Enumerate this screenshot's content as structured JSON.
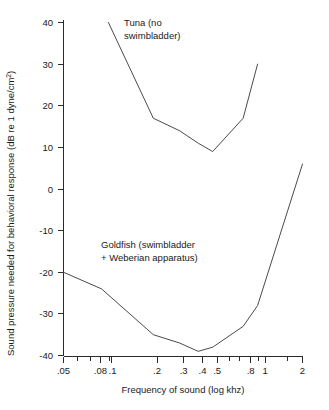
{
  "chart_data": {
    "type": "line",
    "title": "",
    "xlabel": "Frequency of sound (log khz)",
    "ylabel_main": "Sound pressure needed for behavioral response (dB re 1 dyne/cm",
    "ylabel_exponent": "2",
    "ylabel_close": ")",
    "xscale": "log",
    "xlim": [
      0.05,
      2
    ],
    "ylim": [
      -40,
      40
    ],
    "grid": false,
    "legend": "none",
    "x_ticks_labeled": [
      ".05",
      ".08",
      ".1",
      ".2",
      ".3",
      ".4",
      ".5",
      ".8",
      "1",
      "2"
    ],
    "x_tick_values_labeled": [
      0.05,
      0.08,
      0.1,
      0.2,
      0.3,
      0.4,
      0.5,
      0.8,
      1,
      2
    ],
    "x_ticks_minor": [
      0.06,
      0.07,
      0.09,
      0.6,
      0.7,
      0.9,
      1.5
    ],
    "y_ticks": [
      "40",
      "30",
      "20",
      "10",
      "0",
      "-10",
      "-20",
      "-30",
      "-40"
    ],
    "y_tick_values": [
      40,
      30,
      20,
      10,
      0,
      -10,
      -20,
      -30,
      -40
    ],
    "series": [
      {
        "name": "Tuna (no swimbladder)",
        "x": [
          0.1,
          0.2,
          0.3,
          0.4,
          0.5,
          0.8,
          1.0
        ],
        "values": [
          40,
          17,
          14,
          11,
          9,
          17,
          30
        ]
      },
      {
        "name": "Goldfish (swimbladder + Weberian apparatus)",
        "x": [
          0.05,
          0.09,
          0.2,
          0.3,
          0.4,
          0.5,
          0.8,
          1.0,
          2.0
        ],
        "values": [
          -20,
          -24,
          -35,
          -37,
          -39,
          -38,
          -33,
          -28,
          6
        ]
      }
    ],
    "annotations": [
      {
        "name": "tuna-label",
        "line1": "Tuna (no",
        "line2": "swimbladder)"
      },
      {
        "name": "goldfish-label",
        "line1": "Goldfish (swimbladder",
        "line2": "+ Weberian apparatus)"
      }
    ],
    "colors": {
      "line": "#4a4a4a",
      "axis": "#2b2b2b",
      "text": "#1a1a1a",
      "background": "#ffffff"
    }
  }
}
